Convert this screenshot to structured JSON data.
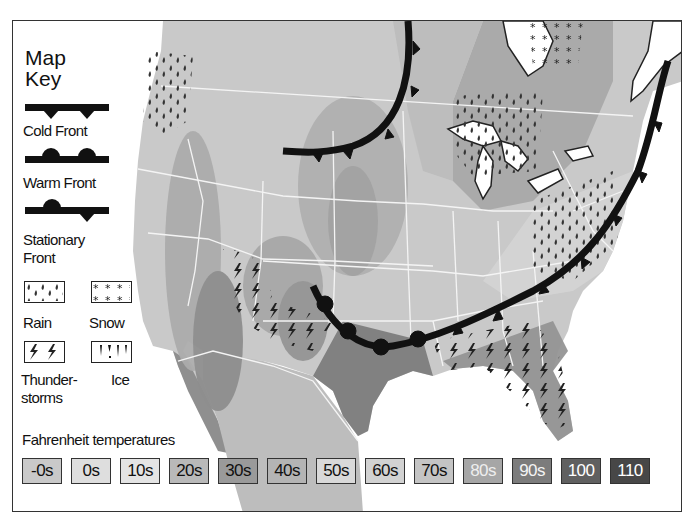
{
  "map": {
    "region": "United States",
    "key": {
      "title_line1": "Map",
      "title_line2": "Key",
      "fronts": [
        {
          "name": "cold-front",
          "label": "Cold Front"
        },
        {
          "name": "warm-front",
          "label": "Warm Front"
        },
        {
          "name": "stationary-front",
          "label_line1": "Stationary",
          "label_line2": "Front"
        }
      ],
      "precipitation": [
        {
          "name": "rain",
          "label": "Rain"
        },
        {
          "name": "snow",
          "label": "Snow"
        },
        {
          "name": "thunderstorms",
          "label_line1": "Thunder-",
          "label_line2": "storms"
        },
        {
          "name": "ice",
          "label": "Ice"
        }
      ]
    },
    "temperatures": {
      "title": "Fahrenheit temperatures",
      "bands": [
        {
          "label": "-0s",
          "fill": "#c9c9c9",
          "text": "#111111"
        },
        {
          "label": "0s",
          "fill": "#dedede",
          "text": "#111111"
        },
        {
          "label": "10s",
          "fill": "#e4e4e4",
          "text": "#111111"
        },
        {
          "label": "20s",
          "fill": "#b9b9b9",
          "text": "#111111"
        },
        {
          "label": "30s",
          "fill": "#9a9a9a",
          "text": "#111111"
        },
        {
          "label": "40s",
          "fill": "#b4b4b4",
          "text": "#111111"
        },
        {
          "label": "50s",
          "fill": "#d9d9d9",
          "text": "#111111"
        },
        {
          "label": "60s",
          "fill": "#d2d2d2",
          "text": "#111111"
        },
        {
          "label": "70s",
          "fill": "#c4c4c4",
          "text": "#111111"
        },
        {
          "label": "80s",
          "fill": "#a6a6a6",
          "text": "#eeeeee"
        },
        {
          "label": "90s",
          "fill": "#7c7c7c",
          "text": "#f4f4f4"
        },
        {
          "label": "100",
          "fill": "#606060",
          "text": "#ffffff"
        },
        {
          "label": "110",
          "fill": "#474747",
          "text": "#ffffff"
        }
      ]
    },
    "colors": {
      "land_base": "#c8c8c8",
      "water": "#ffffff",
      "state_border": "#f2f2f2",
      "front": "#111111"
    }
  }
}
